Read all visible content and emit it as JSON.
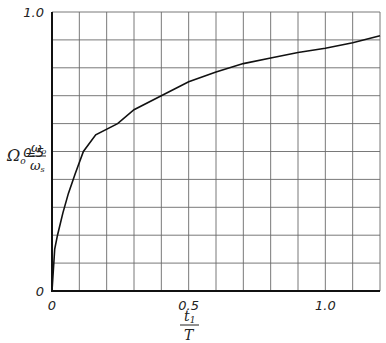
{
  "chart_data": {
    "type": "line",
    "title": "",
    "xlabel": "t1 / T",
    "ylabel": "Ωo = ωo / ωs",
    "xlim": [
      0,
      1.2
    ],
    "ylim": [
      0,
      1.0
    ],
    "grid": true,
    "grid_step_x": 0.1,
    "grid_step_y": 0.1,
    "x_ticks": [
      "0",
      "0.5",
      "1.0"
    ],
    "y_ticks": [
      "0",
      "0.5",
      "1.0"
    ],
    "series": [
      {
        "name": "Ωo",
        "x": [
          0,
          0.01,
          0.02,
          0.04,
          0.06,
          0.085,
          0.115,
          0.16,
          0.24,
          0.3,
          0.4,
          0.5,
          0.6,
          0.7,
          0.8,
          0.9,
          1.0,
          1.1,
          1.2
        ],
        "y": [
          0,
          0.15,
          0.2,
          0.28,
          0.35,
          0.42,
          0.5,
          0.56,
          0.6,
          0.65,
          0.7,
          0.75,
          0.785,
          0.815,
          0.835,
          0.855,
          0.87,
          0.89,
          0.915
        ]
      }
    ]
  },
  "labels": {
    "y_axis_symbol": "Ω",
    "y_axis_sub": "o",
    "y_axis_eq": "=",
    "y_axis_num": "ω",
    "y_axis_num_sub": "o",
    "y_axis_den": "ω",
    "y_axis_den_sub": "s",
    "x_axis_num": "t",
    "x_axis_num_sub": "1",
    "x_axis_den": "T"
  },
  "colors": {
    "grid": "#6a6a6a",
    "axis": "#111111",
    "curve": "#111111",
    "background": "#ffffff"
  }
}
